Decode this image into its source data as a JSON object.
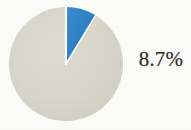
{
  "chart_data": {
    "type": "pie",
    "title": "",
    "labels": [
      "Highlighted share",
      "Remainder"
    ],
    "values": [
      8.7,
      91.3
    ],
    "units": "%",
    "colors": [
      "#2f80c6",
      "#d8d6cb"
    ],
    "slice_colors": {
      "highlight": "#2f80c6",
      "remainder": "#d8d6cb",
      "separator": "#ffffff"
    },
    "start_angle_deg": 0,
    "direction": "clockwise",
    "data_labels": [
      "8.7%"
    ],
    "legend": "none",
    "grid": false,
    "annotations": [
      {
        "text": "8.7%",
        "refers_to": "Highlighted share",
        "position": "right-of-chart"
      }
    ]
  },
  "figure": {
    "background_color": "#fcfcfa",
    "label_text_color": "#37322c",
    "callout_value": "8.7%"
  }
}
